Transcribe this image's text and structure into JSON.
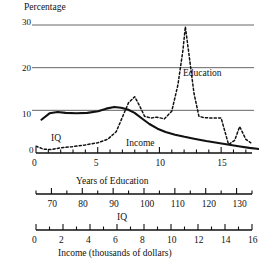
{
  "chart_data": {
    "type": "line",
    "title": "",
    "ylabel": "Percentage",
    "ylim": [
      0,
      30
    ],
    "yticks": [
      0,
      10,
      20,
      30
    ],
    "ytick_labels": [
      "0",
      "10",
      "20",
      "30"
    ],
    "grid": true,
    "grid_lines_at": [
      10,
      20,
      30
    ],
    "legend_position": "inline-annotations",
    "axes": [
      {
        "name": "education-axis",
        "label": "Years of Education",
        "min": 0,
        "max": 17.5,
        "major_ticks": [
          0,
          5,
          10,
          15
        ],
        "major_tick_labels": [
          "0",
          "5",
          "10",
          "15"
        ],
        "minor_tick_step": 1
      },
      {
        "name": "iq-axis",
        "label": "IQ",
        "min": 65,
        "max": 135,
        "major_ticks": [
          70,
          80,
          90,
          100,
          110,
          120,
          130
        ],
        "major_tick_labels": [
          "70",
          "80",
          "90",
          "100",
          "110",
          "120",
          "130"
        ],
        "minor_tick_step": 5
      },
      {
        "name": "income-axis",
        "label": "Income (thousands of dollars)",
        "min": 0,
        "max": 16,
        "major_ticks": [
          0,
          2,
          4,
          6,
          8,
          10,
          12,
          14,
          16
        ],
        "major_tick_labels": [
          "0",
          "2",
          "4",
          "6",
          "8",
          "10",
          "12",
          "14",
          "16"
        ],
        "minor_tick_step": 1
      }
    ],
    "series": [
      {
        "name": "Education",
        "annotation_label": "Education",
        "line_style": "dotted",
        "color": "#111111",
        "x_axis": "education-axis",
        "x": [
          0,
          0.6,
          1.2,
          2,
          3,
          4,
          5,
          5.8,
          6.5,
          7,
          7.5,
          8,
          8.4,
          8.8,
          9.3,
          9.8,
          10.4,
          11,
          11.5,
          11.9,
          12.1,
          12.4,
          12.8,
          13.2,
          13.6,
          14.2,
          15,
          15.6,
          16.1,
          16.5,
          17,
          17.4
        ],
        "y": [
          1.6,
          0.9,
          0.8,
          1.2,
          1.5,
          1.9,
          2.4,
          3.2,
          5.0,
          8.4,
          11.8,
          13.2,
          11.0,
          8.6,
          8.2,
          8.4,
          8.0,
          9.8,
          16.0,
          24.0,
          29.6,
          23.0,
          14.0,
          8.6,
          8.3,
          8.2,
          8.2,
          2.0,
          3.0,
          6.2,
          3.2,
          2.4
        ]
      },
      {
        "name": "IQ",
        "annotation_label": "IQ",
        "line_style": "dashed",
        "color": "#111111",
        "x_axis": "iq-axis",
        "x": [
          0,
          0.5,
          1,
          1.6,
          2.2,
          3,
          3.8,
          4.6,
          5.4,
          6.2,
          7,
          7.6,
          8.2,
          8.7,
          9.2,
          9.7,
          10.3,
          11,
          11.8,
          12.6,
          13.4,
          14.2,
          15,
          15.8,
          16.6,
          17.4
        ],
        "y": [
          1.8,
          0.4,
          0.5,
          1.1,
          1.9,
          3.0,
          4.3,
          5.6,
          7.0,
          8.4,
          10.0,
          11.4,
          12.6,
          13.1,
          12.6,
          11.4,
          9.6,
          8.2,
          7.2,
          6.5,
          6.0,
          5.2,
          4.2,
          3.1,
          2.2,
          1.7
        ]
      },
      {
        "name": "Income",
        "annotation_label": "Income",
        "line_style": "solid",
        "color": "#111111",
        "x_axis": "income-axis",
        "x": [
          0.4,
          1,
          1.6,
          2.2,
          3,
          3.8,
          4.6,
          5.2,
          5.8,
          6.3,
          6.8,
          7.3,
          7.8,
          8.4,
          9,
          9.6,
          10.3,
          11,
          11.8,
          12.6,
          13.4,
          14.2,
          15,
          15.8,
          17.4
        ],
        "y": [
          7.8,
          9.3,
          9.6,
          9.4,
          9.3,
          9.4,
          9.8,
          10.4,
          10.8,
          10.6,
          10.2,
          9.4,
          8.2,
          6.8,
          5.7,
          4.9,
          4.3,
          3.8,
          3.3,
          2.8,
          2.4,
          2.0,
          1.6,
          1.2,
          0.6
        ]
      }
    ]
  }
}
